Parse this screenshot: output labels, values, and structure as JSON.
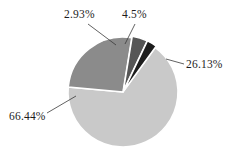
{
  "chart_data": {
    "type": "pie",
    "title": "",
    "subtitle": "",
    "xlabel": "",
    "ylabel": "",
    "grid": false,
    "legend": "none",
    "value_unit": "%",
    "background_color": "#ffffff",
    "label_color": "#1c1c1c",
    "leader_line_color": "#3a3a3a",
    "slice_border_color": "#ffffff",
    "categories": [
      "Slice 1",
      "Slice 2",
      "Slice 3",
      "Slice 4"
    ],
    "values": [
      66.44,
      26.13,
      4.5,
      2.93
    ],
    "labels": [
      "66.44%",
      "26.13%",
      "4.5%",
      "2.93%"
    ],
    "colors": [
      "#c9c9c9",
      "#8b8b8b",
      "#565656",
      "#1d1d1d"
    ],
    "slices": [
      {
        "label": "66.44%",
        "value": 66.44,
        "color": "#c9c9c9",
        "exploded": false
      },
      {
        "label": "26.13%",
        "value": 26.13,
        "color": "#8b8b8b",
        "exploded": false
      },
      {
        "label": "4.5%",
        "value": 4.5,
        "color": "#565656",
        "exploded": true
      },
      {
        "label": "2.93%",
        "value": 2.93,
        "color": "#1d1d1d",
        "exploded": true
      }
    ],
    "total": 100.0,
    "start_angle_deg": 0,
    "direction": "clockwise",
    "center_x": 123,
    "center_y": 92,
    "radius": 55
  },
  "labels": {
    "top_left": "2.93%",
    "top_right": "4.5%",
    "right": "26.13%",
    "bottom_left": "66.44%"
  }
}
